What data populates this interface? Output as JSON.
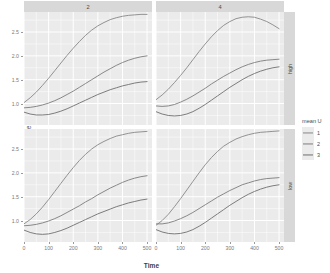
{
  "chart_data": {
    "type": "line",
    "title": "",
    "subtitle": "",
    "xlabel": "Time",
    "ylabel": "Prevalence ratio (PgPd)",
    "xlim": [
      0,
      520
    ],
    "ylim": [
      0.55,
      2.92
    ],
    "xticks": [
      0,
      100,
      200,
      300,
      400,
      500
    ],
    "xticklabels": [
      "0",
      "100",
      "200",
      "300",
      "400",
      "500"
    ],
    "yticks": [
      1.0,
      1.5,
      2.0,
      2.5
    ],
    "yticklabels": [
      "1.0",
      "1.5",
      "2.0",
      "2.5"
    ],
    "grid": true,
    "grid_color": "#ffffff",
    "panel_background": "#ebebeb",
    "legend": {
      "title": "mean U",
      "position": "right",
      "entries": [
        {
          "label": "1",
          "color": "#888888"
        },
        {
          "label": "2",
          "color": "#7d7d7d"
        },
        {
          "label": "3",
          "color": "#6f6f6f"
        }
      ]
    },
    "facets": {
      "col_variable": "",
      "col_levels": [
        "2",
        "4"
      ],
      "row_variable": "",
      "row_levels": [
        "high",
        "low"
      ]
    },
    "panels": [
      {
        "row": "high",
        "col": "2",
        "series": [
          {
            "name": "1",
            "color": "#888888",
            "x": [
              0,
              25,
              50,
              75,
              100,
              125,
              150,
              175,
              200,
              225,
              250,
              275,
              300,
              325,
              350,
              375,
              400,
              425,
              450,
              475,
              500
            ],
            "y": [
              1.02,
              1.12,
              1.24,
              1.38,
              1.53,
              1.69,
              1.85,
              2.01,
              2.16,
              2.3,
              2.43,
              2.54,
              2.63,
              2.7,
              2.76,
              2.8,
              2.83,
              2.85,
              2.86,
              2.87,
              2.87
            ]
          },
          {
            "name": "2",
            "color": "#7d7d7d",
            "x": [
              0,
              25,
              50,
              75,
              100,
              125,
              150,
              175,
              200,
              225,
              250,
              275,
              300,
              325,
              350,
              375,
              400,
              425,
              450,
              475,
              500
            ],
            "y": [
              0.91,
              0.92,
              0.94,
              0.97,
              1.01,
              1.06,
              1.12,
              1.19,
              1.26,
              1.34,
              1.42,
              1.5,
              1.58,
              1.66,
              1.73,
              1.8,
              1.86,
              1.91,
              1.95,
              1.98,
              2.0
            ]
          },
          {
            "name": "3",
            "color": "#6f6f6f",
            "x": [
              0,
              25,
              50,
              75,
              100,
              125,
              150,
              175,
              200,
              225,
              250,
              275,
              300,
              325,
              350,
              375,
              400,
              425,
              450,
              475,
              500
            ],
            "y": [
              0.82,
              0.78,
              0.76,
              0.76,
              0.77,
              0.8,
              0.84,
              0.89,
              0.95,
              1.01,
              1.07,
              1.13,
              1.19,
              1.24,
              1.29,
              1.33,
              1.37,
              1.4,
              1.43,
              1.45,
              1.46
            ]
          }
        ]
      },
      {
        "row": "high",
        "col": "4",
        "series": [
          {
            "name": "1",
            "color": "#888888",
            "x": [
              0,
              25,
              50,
              75,
              100,
              125,
              150,
              175,
              200,
              225,
              250,
              275,
              300,
              325,
              350,
              375,
              400,
              425,
              450,
              475,
              500
            ],
            "y": [
              1.08,
              1.18,
              1.3,
              1.44,
              1.59,
              1.75,
              1.92,
              2.09,
              2.25,
              2.4,
              2.53,
              2.64,
              2.72,
              2.78,
              2.81,
              2.82,
              2.81,
              2.77,
              2.72,
              2.65,
              2.57
            ]
          },
          {
            "name": "2",
            "color": "#7d7d7d",
            "x": [
              0,
              25,
              50,
              75,
              100,
              125,
              150,
              175,
              200,
              225,
              250,
              275,
              300,
              325,
              350,
              375,
              400,
              425,
              450,
              475,
              500
            ],
            "y": [
              0.95,
              0.94,
              0.95,
              0.98,
              1.03,
              1.09,
              1.16,
              1.24,
              1.32,
              1.41,
              1.49,
              1.57,
              1.64,
              1.71,
              1.77,
              1.82,
              1.86,
              1.89,
              1.91,
              1.92,
              1.93
            ]
          },
          {
            "name": "3",
            "color": "#6f6f6f",
            "x": [
              0,
              25,
              50,
              75,
              100,
              125,
              150,
              175,
              200,
              225,
              250,
              275,
              300,
              325,
              350,
              375,
              400,
              425,
              450,
              475,
              500
            ],
            "y": [
              0.83,
              0.78,
              0.75,
              0.74,
              0.75,
              0.78,
              0.83,
              0.9,
              0.98,
              1.07,
              1.16,
              1.25,
              1.34,
              1.42,
              1.5,
              1.57,
              1.63,
              1.68,
              1.72,
              1.75,
              1.77
            ]
          }
        ]
      },
      {
        "row": "low",
        "col": "2",
        "series": [
          {
            "name": "1",
            "color": "#888888",
            "x": [
              0,
              25,
              50,
              75,
              100,
              125,
              150,
              175,
              200,
              225,
              250,
              275,
              300,
              325,
              350,
              375,
              400,
              425,
              450,
              475,
              500
            ],
            "y": [
              0.93,
              1.02,
              1.14,
              1.28,
              1.44,
              1.61,
              1.78,
              1.95,
              2.11,
              2.26,
              2.39,
              2.5,
              2.59,
              2.66,
              2.72,
              2.77,
              2.8,
              2.83,
              2.85,
              2.86,
              2.87
            ]
          },
          {
            "name": "2",
            "color": "#7d7d7d",
            "x": [
              0,
              25,
              50,
              75,
              100,
              125,
              150,
              175,
              200,
              225,
              250,
              275,
              300,
              325,
              350,
              375,
              400,
              425,
              450,
              475,
              500
            ],
            "y": [
              0.89,
              0.9,
              0.92,
              0.95,
              0.99,
              1.04,
              1.1,
              1.17,
              1.24,
              1.31,
              1.39,
              1.46,
              1.54,
              1.61,
              1.68,
              1.74,
              1.8,
              1.85,
              1.89,
              1.92,
              1.94
            ]
          },
          {
            "name": "3",
            "color": "#6f6f6f",
            "x": [
              0,
              25,
              50,
              75,
              100,
              125,
              150,
              175,
              200,
              225,
              250,
              275,
              300,
              325,
              350,
              375,
              400,
              425,
              450,
              475,
              500
            ],
            "y": [
              0.8,
              0.75,
              0.72,
              0.71,
              0.72,
              0.75,
              0.79,
              0.84,
              0.9,
              0.96,
              1.02,
              1.08,
              1.14,
              1.19,
              1.24,
              1.29,
              1.33,
              1.37,
              1.4,
              1.43,
              1.45
            ]
          }
        ]
      },
      {
        "row": "low",
        "col": "4",
        "series": [
          {
            "name": "1",
            "color": "#888888",
            "x": [
              0,
              25,
              50,
              75,
              100,
              125,
              150,
              175,
              200,
              225,
              250,
              275,
              300,
              325,
              350,
              375,
              400,
              425,
              450,
              475,
              500
            ],
            "y": [
              0.9,
              1.0,
              1.13,
              1.29,
              1.46,
              1.64,
              1.82,
              2.0,
              2.17,
              2.32,
              2.45,
              2.56,
              2.64,
              2.71,
              2.76,
              2.8,
              2.83,
              2.85,
              2.86,
              2.87,
              2.88
            ]
          },
          {
            "name": "2",
            "color": "#7d7d7d",
            "x": [
              0,
              25,
              50,
              75,
              100,
              125,
              150,
              175,
              200,
              225,
              250,
              275,
              300,
              325,
              350,
              375,
              400,
              425,
              450,
              475,
              500
            ],
            "y": [
              0.93,
              0.93,
              0.95,
              0.99,
              1.04,
              1.1,
              1.17,
              1.25,
              1.33,
              1.41,
              1.49,
              1.56,
              1.63,
              1.69,
              1.75,
              1.79,
              1.83,
              1.86,
              1.88,
              1.89,
              1.9
            ]
          },
          {
            "name": "3",
            "color": "#6f6f6f",
            "x": [
              0,
              25,
              50,
              75,
              100,
              125,
              150,
              175,
              200,
              225,
              250,
              275,
              300,
              325,
              350,
              375,
              400,
              425,
              450,
              475,
              500
            ],
            "y": [
              0.81,
              0.76,
              0.73,
              0.72,
              0.73,
              0.76,
              0.81,
              0.88,
              0.96,
              1.05,
              1.14,
              1.23,
              1.32,
              1.4,
              1.48,
              1.55,
              1.61,
              1.66,
              1.7,
              1.73,
              1.75
            ]
          }
        ]
      }
    ]
  }
}
